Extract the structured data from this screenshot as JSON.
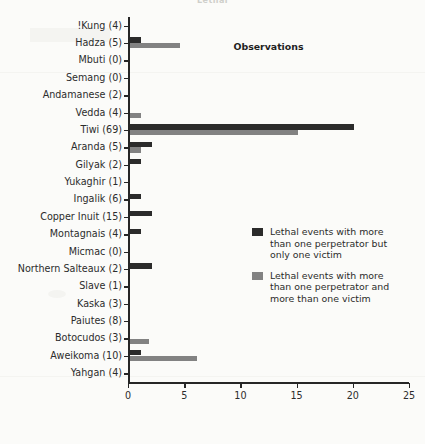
{
  "partial_title": "Lethal",
  "chart_data": {
    "type": "bar",
    "orientation": "horizontal",
    "title": "",
    "xlabel": "Observations",
    "ylabel": "",
    "xlim": [
      0,
      25
    ],
    "xticks": [
      0,
      5,
      10,
      15,
      20,
      25
    ],
    "grid": false,
    "legend_position": "center-right",
    "categories": [
      "!Kung (4)",
      "Hadza (5)",
      "Mbuti (0)",
      "Semang (0)",
      "Andamanese (2)",
      "Vedda (4)",
      "Tiwi (69)",
      "Aranda (5)",
      "Gilyak (2)",
      "Yukaghir (1)",
      "Ingalik (6)",
      "Copper Inuit (15)",
      "Montagnais (4)",
      "Micmac (0)",
      "Northern Salteaux (2)",
      "Slave (1)",
      "Kaska (3)",
      "Paiutes (8)",
      "Botocudos (3)",
      "Aweikoma (10)",
      "Yahgan (4)"
    ],
    "series": [
      {
        "name": "Lethal events with more than one perpetrator but only one victim",
        "color": "#2b2b2b",
        "values": [
          0,
          1.0,
          0,
          0,
          0,
          0,
          20.0,
          2.0,
          1.0,
          0,
          1.0,
          2.0,
          1.0,
          0,
          2.0,
          0,
          0,
          0,
          0,
          1.0,
          0
        ]
      },
      {
        "name": "Lethal events with more than one perpetrator and more than one victim",
        "color": "#828282",
        "values": [
          0,
          4.5,
          0,
          0,
          0,
          1.0,
          15.0,
          1.0,
          0,
          0,
          0,
          0,
          0,
          0,
          0,
          0,
          0,
          0,
          1.7,
          6.0,
          0
        ]
      }
    ]
  }
}
